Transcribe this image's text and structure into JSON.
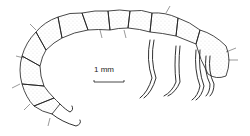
{
  "figure": {
    "scale_bar": {
      "label": "1 mm"
    },
    "colors": {
      "ink": "#1a1a1a",
      "background": "#ffffff",
      "stipple": "#777777"
    }
  }
}
